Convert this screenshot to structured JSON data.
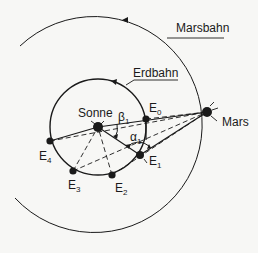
{
  "diagram": {
    "type": "orbital-geometry",
    "labels": {
      "mars_orbit": "Marsbahn",
      "earth_orbit": "Erdbahn",
      "sun": "Sonne",
      "mars": "Mars",
      "beta": "β",
      "beta_sub": "1",
      "alpha": "α",
      "alpha_sub": "1"
    },
    "earth_positions": [
      {
        "id": "E0",
        "letter": "E",
        "sub": "0"
      },
      {
        "id": "E1",
        "letter": "E",
        "sub": "1"
      },
      {
        "id": "E2",
        "letter": "E",
        "sub": "2"
      },
      {
        "id": "E3",
        "letter": "E",
        "sub": "3"
      },
      {
        "id": "E4",
        "letter": "E",
        "sub": "4"
      }
    ],
    "colors": {
      "ink": "#1a1a1a",
      "paper": "#f7f7f5"
    }
  }
}
